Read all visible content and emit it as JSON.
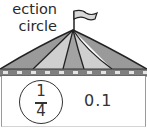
{
  "instructions": {
    "line1": "ection",
    "line2": "circle"
  },
  "card": {
    "fraction": {
      "numerator": "1",
      "denominator": "4"
    },
    "decimal": "0.1"
  },
  "colors": {
    "roof_dark": "#8f8f8f",
    "roof_light": "#c8c8c8",
    "outline": "#222222",
    "trim_dark": "#7a7a7a",
    "trim_light": "#e2e2e2"
  }
}
